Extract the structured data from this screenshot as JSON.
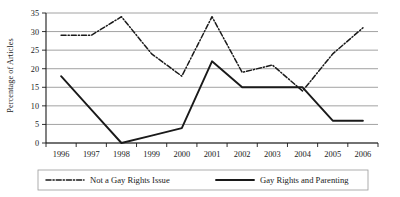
{
  "chart_data": {
    "type": "line",
    "title": "",
    "xlabel": "",
    "ylabel": "Percentage of Articles",
    "categories": [
      "1996",
      "1997",
      "1998",
      "1999",
      "2000",
      "2001",
      "2002",
      "2003",
      "2004",
      "2005",
      "2006"
    ],
    "ylim": [
      0,
      35
    ],
    "yticks": [
      0,
      5,
      10,
      15,
      20,
      25,
      30,
      35
    ],
    "ytick_labels": [
      "0",
      "5",
      "10",
      "15",
      "20",
      "25",
      "30",
      "35"
    ],
    "grid": "horizontal",
    "legend_position": "bottom",
    "series": [
      {
        "name": "Not a Gay Rights Issue",
        "style": "dash-dot",
        "color": "#1a1a1a",
        "values": [
          29,
          29,
          34,
          24,
          18,
          34,
          19,
          21,
          14,
          24,
          31
        ]
      },
      {
        "name": "Gay Rights and Parenting",
        "style": "solid",
        "color": "#1a1a1a",
        "values": [
          18,
          9,
          0,
          2,
          4,
          22,
          15,
          15,
          15,
          6,
          6
        ]
      }
    ]
  },
  "legend": {
    "items": [
      {
        "label": "Not a Gay Rights Issue",
        "style": "dash-dot"
      },
      {
        "label": "Gay Rights and Parenting",
        "style": "solid"
      }
    ]
  },
  "colors": {
    "axis": "#1a1a1a",
    "grid": "#8a8a8a",
    "series_primary": "#1a1a1a",
    "background": "#ffffff"
  }
}
